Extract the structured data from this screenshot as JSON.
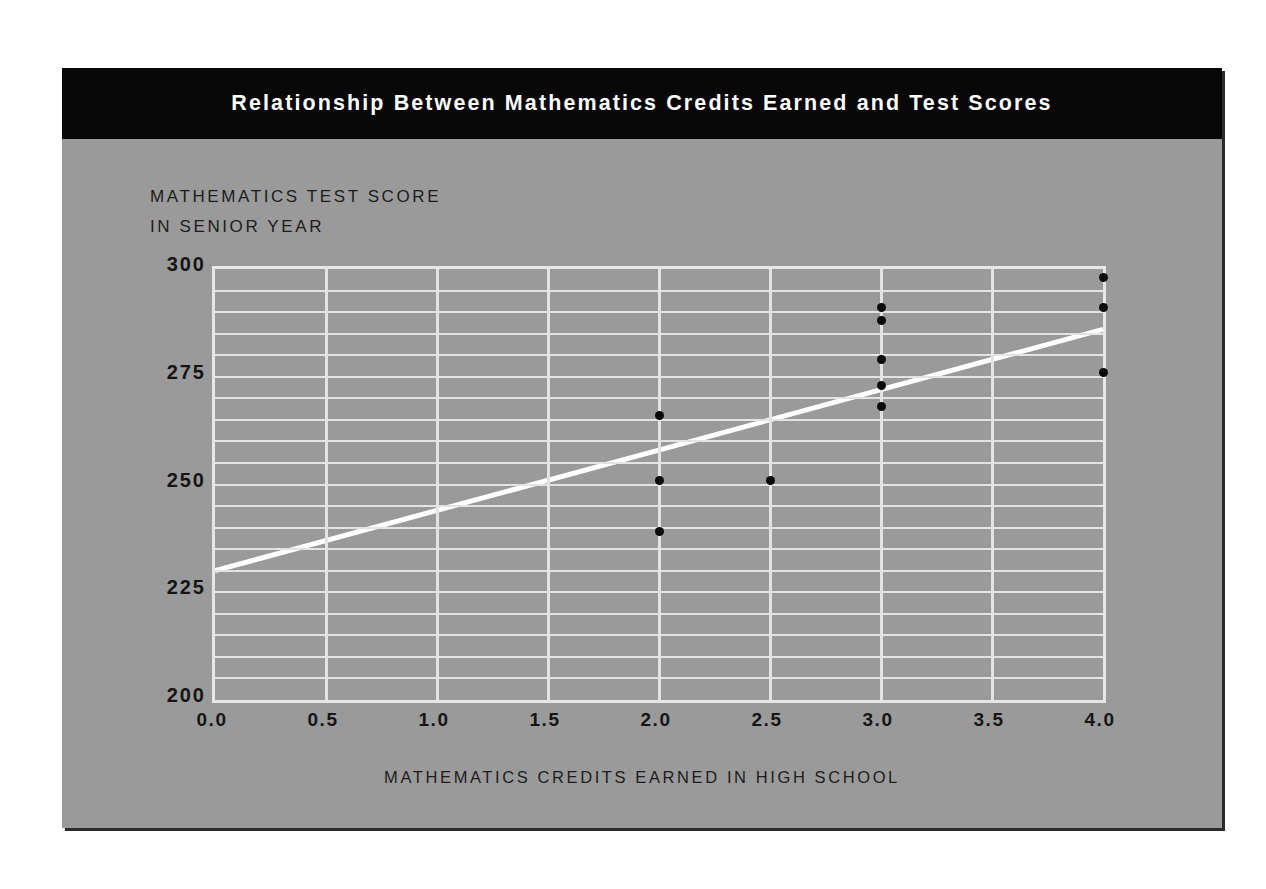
{
  "slide": {
    "title": "Relationship Between Mathematics Credits Earned and Test Scores",
    "background_color": "#9a9a9a",
    "title_band_color": "#070707",
    "title_text_color": "#ffffff"
  },
  "chart_data": {
    "type": "scatter",
    "title": "Relationship Between Mathematics Credits Earned and Test Scores",
    "xlabel": "MATHEMATICS CREDITS EARNED IN HIGH SCHOOL",
    "ylabel": "MATHEMATICS TEST SCORE IN SENIOR YEAR",
    "ylabel_line1": "MATHEMATICS TEST SCORE",
    "ylabel_line2": "IN SENIOR YEAR",
    "xlim": [
      0.0,
      4.0
    ],
    "ylim": [
      200,
      300
    ],
    "xticks": [
      "0.0",
      "0.5",
      "1.0",
      "1.5",
      "2.0",
      "2.5",
      "3.0",
      "3.5",
      "4.0"
    ],
    "xtick_values": [
      0.0,
      0.5,
      1.0,
      1.5,
      2.0,
      2.5,
      3.0,
      3.5,
      4.0
    ],
    "yticks": [
      "200",
      "225",
      "250",
      "275",
      "300"
    ],
    "ytick_values": [
      200,
      225,
      250,
      275,
      300
    ],
    "grid": true,
    "grid_color": "#e3e3e3",
    "grid_x_step": 0.5,
    "grid_y_step": 5,
    "legend": false,
    "point_color": "#0a0a0a",
    "points": [
      {
        "x": 2.0,
        "y": 266
      },
      {
        "x": 2.0,
        "y": 251
      },
      {
        "x": 2.0,
        "y": 239
      },
      {
        "x": 2.5,
        "y": 251
      },
      {
        "x": 3.0,
        "y": 291
      },
      {
        "x": 3.0,
        "y": 288
      },
      {
        "x": 3.0,
        "y": 279
      },
      {
        "x": 3.0,
        "y": 273
      },
      {
        "x": 3.0,
        "y": 268
      },
      {
        "x": 4.0,
        "y": 298
      },
      {
        "x": 4.0,
        "y": 291
      },
      {
        "x": 4.0,
        "y": 276
      }
    ],
    "trendline": {
      "color": "#ffffff",
      "x_start": 0.0,
      "y_start": 230,
      "x_end": 4.0,
      "y_end": 286
    }
  }
}
